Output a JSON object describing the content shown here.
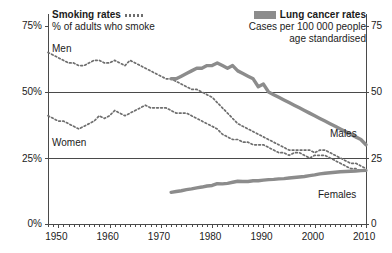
{
  "legend": {
    "left": {
      "title": "Smoking rates",
      "subtitle": "% of adults who smoke",
      "swatch": "dotted-line-swatch"
    },
    "right": {
      "title": "Lung cancer rates",
      "subtitle_line1": "Cases per 100 000 people",
      "subtitle_line2": "age standardised",
      "swatch": "thick-grey-line-swatch"
    }
  },
  "series_labels": {
    "men_smoking": "Men",
    "women_smoking": "Women",
    "males_cancer": "Males",
    "females_cancer": "Females"
  },
  "axes": {
    "left_ticks": [
      "75%",
      "50%",
      "25%",
      "0%"
    ],
    "right_ticks": [
      "75",
      "50",
      "25",
      "0"
    ],
    "x_ticks": [
      "1950",
      "1960",
      "1970",
      "1980",
      "1990",
      "2000",
      "2010"
    ]
  },
  "colors": {
    "dotted_line": "#6e6e6e",
    "solid_line": "#8c8c8c",
    "axis": "#4a4a4a",
    "gridline": "#4a4a4a",
    "text": "#1b1b1b",
    "background": "#ffffff"
  },
  "chart_data": {
    "type": "line",
    "title": "",
    "xlabel": "",
    "ylabel": "",
    "xlim": [
      1948,
      2010
    ],
    "ylim_left": [
      0,
      75
    ],
    "ylim_right": [
      0,
      75
    ],
    "left_axis_label": "% of adults who smoke",
    "right_axis_label": "Cases per 100 000 people age standardised",
    "yticks_left": [
      0,
      25,
      50,
      75
    ],
    "yticks_right": [
      0,
      25,
      50,
      75
    ],
    "xticks": [
      1950,
      1960,
      1970,
      1980,
      1990,
      2000,
      2010
    ],
    "xtick_minor_step": 1,
    "grid": "horizontal-at-25-and-50",
    "legend_position": "top",
    "series": [
      {
        "name": "Men",
        "label": "Men",
        "axis": "left",
        "style": "dotted",
        "units": "% of adults who smoke",
        "x": [
          1948,
          1949,
          1950,
          1951,
          1952,
          1953,
          1954,
          1955,
          1956,
          1957,
          1958,
          1959,
          1960,
          1961,
          1962,
          1963,
          1964,
          1965,
          1966,
          1967,
          1968,
          1969,
          1970,
          1971,
          1972,
          1973,
          1974,
          1975,
          1976,
          1977,
          1978,
          1979,
          1980,
          1981,
          1982,
          1983,
          1984,
          1985,
          1986,
          1987,
          1988,
          1989,
          1990,
          1991,
          1992,
          1993,
          1994,
          1995,
          1996,
          1997,
          1998,
          1999,
          2000,
          2001,
          2002,
          2003,
          2004,
          2005,
          2006,
          2007,
          2008,
          2009,
          2010
        ],
        "y": [
          65,
          64,
          63,
          62,
          61,
          61,
          60,
          60,
          61,
          62,
          62,
          61,
          61,
          62,
          61,
          60,
          62,
          61,
          60,
          59,
          58,
          57,
          56,
          55,
          55,
          54,
          53,
          52,
          51,
          51,
          50,
          49,
          48,
          46,
          44,
          42,
          40,
          38,
          37,
          36,
          35,
          34,
          33,
          32,
          31,
          30,
          29,
          28,
          28,
          28,
          28,
          28,
          27,
          28,
          28,
          27,
          26,
          25,
          24,
          23,
          23,
          22,
          21
        ]
      },
      {
        "name": "Women",
        "label": "Women",
        "axis": "left",
        "style": "dotted",
        "units": "% of adults who smoke",
        "x": [
          1948,
          1949,
          1950,
          1951,
          1952,
          1953,
          1954,
          1955,
          1956,
          1957,
          1958,
          1959,
          1960,
          1961,
          1962,
          1963,
          1964,
          1965,
          1966,
          1967,
          1968,
          1969,
          1970,
          1971,
          1972,
          1973,
          1974,
          1975,
          1976,
          1977,
          1978,
          1979,
          1980,
          1981,
          1982,
          1983,
          1984,
          1985,
          1986,
          1987,
          1988,
          1989,
          1990,
          1991,
          1992,
          1993,
          1994,
          1995,
          1996,
          1997,
          1998,
          1999,
          2000,
          2001,
          2002,
          2003,
          2004,
          2005,
          2006,
          2007,
          2008,
          2009,
          2010
        ],
        "y": [
          41,
          40,
          39,
          39,
          38,
          37,
          36,
          37,
          38,
          39,
          41,
          40,
          41,
          43,
          42,
          41,
          42,
          43,
          44,
          45,
          44,
          44,
          44,
          44,
          43,
          42,
          42,
          42,
          41,
          40,
          39,
          38,
          37,
          36,
          34,
          33,
          32,
          32,
          31,
          31,
          30,
          30,
          30,
          29,
          28,
          27,
          27,
          26,
          27,
          27,
          26,
          25,
          26,
          26,
          26,
          25,
          24,
          23,
          22,
          21,
          21,
          20,
          20
        ]
      },
      {
        "name": "Males",
        "label": "Males",
        "axis": "right",
        "style": "solid",
        "units": "cases per 100 000 people, age standardised",
        "x": [
          1972,
          1973,
          1974,
          1975,
          1976,
          1977,
          1978,
          1979,
          1980,
          1981,
          1982,
          1983,
          1984,
          1985,
          1986,
          1987,
          1988,
          1989,
          1990,
          1991,
          1992,
          1993,
          1994,
          1995,
          1996,
          1997,
          1998,
          1999,
          2000,
          2001,
          2002,
          2003,
          2004,
          2005,
          2006,
          2007,
          2008,
          2009,
          2010
        ],
        "y": [
          55,
          55,
          56,
          57,
          58,
          59,
          59,
          60,
          60,
          61,
          60,
          59,
          60,
          58,
          57,
          56,
          55,
          52,
          53,
          50,
          49,
          48,
          47,
          46,
          45,
          44,
          43,
          42,
          41,
          40,
          39,
          38,
          37,
          36,
          35,
          34,
          33,
          32,
          30
        ]
      },
      {
        "name": "Females",
        "label": "Females",
        "axis": "right",
        "style": "solid",
        "units": "cases per 100 000 people, age standardised",
        "x": [
          1972,
          1973,
          1974,
          1975,
          1976,
          1977,
          1978,
          1979,
          1980,
          1981,
          1982,
          1983,
          1984,
          1985,
          1986,
          1987,
          1988,
          1989,
          1990,
          1991,
          1992,
          1993,
          1994,
          1995,
          1996,
          1997,
          1998,
          1999,
          2000,
          2001,
          2002,
          2003,
          2004,
          2005,
          2006,
          2007,
          2008,
          2009,
          2010
        ],
        "y": [
          12,
          12.3,
          12.6,
          13,
          13.3,
          13.7,
          14,
          14.4,
          14.6,
          15.3,
          15.2,
          15.4,
          15.8,
          16.2,
          16.1,
          16.1,
          16.4,
          16.4,
          16.6,
          16.8,
          16.9,
          17.1,
          17.2,
          17.4,
          17.6,
          17.8,
          18,
          18.3,
          18.6,
          19,
          19.2,
          19.4,
          19.6,
          19.8,
          19.9,
          20,
          20.1,
          20.2,
          20.3
        ]
      }
    ]
  }
}
